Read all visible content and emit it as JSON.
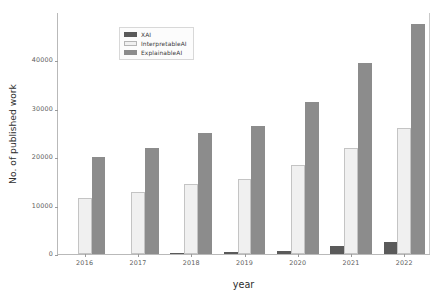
{
  "chart_data": {
    "type": "bar",
    "title": "",
    "xlabel": "year",
    "ylabel": "No. of published work",
    "categories": [
      "2016",
      "2017",
      "2018",
      "2019",
      "2020",
      "2021",
      "2022"
    ],
    "series": [
      {
        "name": "XAI",
        "color": "#5a5a5a",
        "values": [
          0,
          0,
          200,
          400,
          700,
          1700,
          2500
        ]
      },
      {
        "name": "InterpretableAI",
        "color": "#f0f0f0",
        "values": [
          11500,
          12800,
          14400,
          15500,
          18400,
          22000,
          26000
        ]
      },
      {
        "name": "ExplainableAI",
        "color": "#8c8c8c",
        "values": [
          20000,
          22000,
          25000,
          26500,
          31500,
          39500,
          47500
        ]
      }
    ],
    "ylim": [
      0,
      50000
    ],
    "yticks": [
      0,
      10000,
      20000,
      30000,
      40000
    ],
    "ytick_labels": [
      "0",
      "10000",
      "20000",
      "30000",
      "40000"
    ],
    "grid": false,
    "legend_position": "upper left"
  },
  "legend": {
    "entries": [
      {
        "label": "XAI"
      },
      {
        "label": "InterpretableAI"
      },
      {
        "label": "ExplainableAI"
      }
    ]
  },
  "axes": {
    "x_title": "year",
    "y_title": "No. of published work"
  }
}
